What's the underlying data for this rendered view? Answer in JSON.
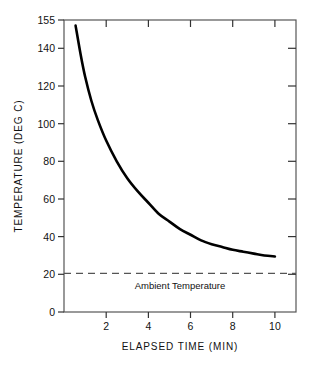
{
  "chart_data": {
    "type": "line",
    "title": "",
    "xlabel": "ELAPSED TIME (MIN)",
    "ylabel": "TEMPERATURE (DEG C)",
    "xlim": [
      0,
      11
    ],
    "ylim": [
      0,
      155
    ],
    "grid": false,
    "legend": "none",
    "xticks": [
      2,
      4,
      6,
      8,
      10
    ],
    "xtick_labels": [
      "2",
      "4",
      "6",
      "8",
      "10"
    ],
    "yticks": [
      0,
      20,
      40,
      60,
      80,
      100,
      120,
      140,
      155
    ],
    "ytick_labels": [
      "0",
      "20",
      "40",
      "60",
      "80",
      "100",
      "120",
      "140",
      "155"
    ],
    "series": [
      {
        "name": "Temperature decay",
        "style": "solid",
        "color": "#000000",
        "x": [
          0.55,
          0.8,
          1.0,
          1.3,
          1.6,
          2.0,
          2.5,
          3.0,
          3.5,
          4.0,
          4.5,
          5.0,
          5.5,
          6.0,
          6.5,
          7.0,
          7.5,
          8.0,
          8.5,
          9.0,
          9.5,
          10.0
        ],
        "y": [
          152,
          136,
          125,
          112,
          102,
          91,
          80,
          71,
          64,
          58,
          52,
          48,
          44,
          41,
          38,
          36,
          34.5,
          33,
          32,
          31,
          30,
          29.5
        ]
      },
      {
        "name": "Ambient Temperature",
        "style": "dashed",
        "color": "#555555",
        "x": [
          0,
          11
        ],
        "y": [
          20.5,
          20.5
        ]
      }
    ],
    "annotations": [
      {
        "text": "Ambient Temperature",
        "x": 5.5,
        "y": 14
      }
    ]
  },
  "figure": {
    "axis_color": "#444444",
    "curve_color": "#000000",
    "ambient_color": "#666666",
    "background": "#ffffff"
  }
}
